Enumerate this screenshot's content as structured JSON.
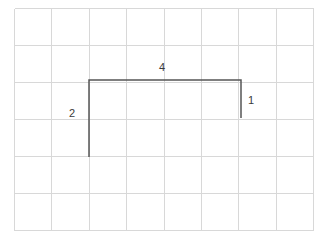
{
  "figure": {
    "title": "",
    "background_color": "#ffffff",
    "grid": {
      "columns": 8,
      "rows": 6,
      "origin_x": 14,
      "origin_y": 8,
      "cell_width": 37.4,
      "cell_height": 37.0,
      "line_color": "#d8d8d8",
      "line_width": 1
    },
    "shape": {
      "type": "open-polyline",
      "description": "three-sided bracket / staple shape drawn on grid paper",
      "stroke_color": "#555555",
      "stroke_width": 1.5,
      "points": [
        {
          "x": 89,
          "y": 157
        },
        {
          "x": 89,
          "y": 80
        },
        {
          "x": 241,
          "y": 80
        },
        {
          "x": 241,
          "y": 118
        }
      ],
      "segments": [
        {
          "name": "left-side",
          "length_label": "2",
          "units_in_cells": 2
        },
        {
          "name": "top-side",
          "length_label": "4",
          "units_in_cells": 4
        },
        {
          "name": "right-side",
          "length_label": "1",
          "units_in_cells": 1
        }
      ]
    },
    "labels": {
      "top": "4",
      "left": "2",
      "right": "1"
    }
  },
  "chart_data": {
    "type": "line",
    "title": "",
    "xlabel": "",
    "ylabel": "",
    "grid": true,
    "legend": "none",
    "xlim": [
      0,
      8
    ],
    "ylim": [
      0,
      6
    ],
    "series": [
      {
        "name": "bracket-path",
        "x": [
          2,
          2,
          6,
          6
        ],
        "y": [
          4,
          2,
          2,
          3
        ]
      }
    ],
    "annotations": [
      {
        "text": "4",
        "x": 4,
        "y": 1.7,
        "segment": "top"
      },
      {
        "text": "2",
        "x": 1.6,
        "y": 3.0,
        "segment": "left"
      },
      {
        "text": "1",
        "x": 6.4,
        "y": 2.5,
        "segment": "right"
      }
    ]
  }
}
